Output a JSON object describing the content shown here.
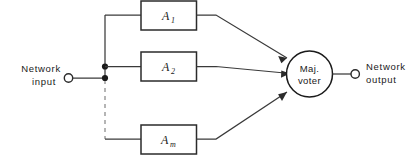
{
  "diagram": {
    "input_terminal": {
      "label_line1": "Network",
      "label_line2": "input"
    },
    "output_terminal": {
      "label_line1": "Network",
      "label_line2": "output"
    },
    "voter": {
      "label_line1": "Maj.",
      "label_line2": "voter"
    },
    "blocks": [
      {
        "base": "A",
        "sub": "1"
      },
      {
        "base": "A",
        "sub": "2"
      },
      {
        "base": "A",
        "sub": "m"
      }
    ],
    "ellipsis_note": "dashed line indicates omitted intermediate blocks",
    "colors": {
      "background": "#ffffff",
      "wire": "#3a3a3a",
      "dashed_wire": "#8a8a8a",
      "block_stroke": "#2b2b2b",
      "text": "#1a1a1a"
    }
  }
}
